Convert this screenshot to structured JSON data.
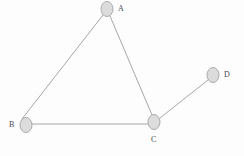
{
  "diagram": {
    "type": "undirected-graph",
    "title": "",
    "canvas": {
      "width": 244,
      "height": 156,
      "background": "#fdfdfd"
    },
    "style": {
      "node_fill": "#dcdcdc",
      "node_stroke": "#9a9aa0",
      "node_stroke_width": 0.8,
      "node_rx": 6,
      "node_ry": 7.5,
      "edge_color": "#9c9ca4",
      "edge_width": 0.9,
      "label_color": "#4a4a52",
      "label_font_size": 8
    },
    "nodes": [
      {
        "id": "A",
        "label": "A",
        "cx": 107,
        "cy": 9,
        "label_x": 118,
        "label_y": 5,
        "label_pos": "right"
      },
      {
        "id": "B",
        "label": "B",
        "cx": 26,
        "cy": 125,
        "label_x": 9,
        "label_y": 121,
        "label_pos": "left"
      },
      {
        "id": "C",
        "label": "C",
        "cx": 154,
        "cy": 122,
        "label_x": 151,
        "label_y": 136,
        "label_pos": "below"
      },
      {
        "id": "D",
        "label": "D",
        "cx": 213,
        "cy": 75,
        "label_x": 224,
        "label_y": 71,
        "label_pos": "right"
      }
    ],
    "edges": [
      {
        "id": "edge-a-b",
        "from": "A",
        "to": "B",
        "x1": 103,
        "y1": 15,
        "x2": 22,
        "y2": 119
      },
      {
        "id": "edge-a-c",
        "from": "A",
        "to": "C",
        "x1": 110,
        "y1": 16,
        "x2": 152,
        "y2": 115
      },
      {
        "id": "edge-b-c",
        "from": "B",
        "to": "C",
        "x1": 32,
        "y1": 124,
        "x2": 148,
        "y2": 124
      },
      {
        "id": "edge-c-d",
        "from": "C",
        "to": "D",
        "x1": 160,
        "y1": 118,
        "x2": 208,
        "y2": 80
      }
    ]
  }
}
